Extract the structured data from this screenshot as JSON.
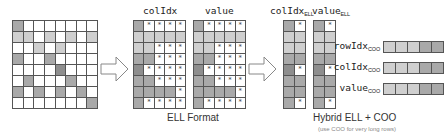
{
  "colors": {
    "grid_line": "#555555",
    "empty": "#ffffff",
    "light": "#cfcfcf",
    "mid": "#a9a9a9",
    "dark": "#8e8e8e",
    "arrow_stroke": "#888888"
  },
  "dense_matrix": {
    "rows": 8,
    "cols": 8,
    "cells": [
      [
        "mid",
        "",
        "",
        "",
        "",
        "",
        "",
        ""
      ],
      [
        "light",
        "light",
        "",
        "light",
        "",
        "light",
        "",
        "light"
      ],
      [
        "",
        "",
        "light",
        "",
        "light",
        "",
        "",
        ""
      ],
      [
        "mid",
        "",
        "",
        "mid",
        "",
        "",
        "",
        ""
      ],
      [
        "",
        "",
        "",
        "",
        "dark",
        "",
        "",
        ""
      ],
      [
        "",
        "mid",
        "",
        "",
        "",
        "mid",
        "",
        ""
      ],
      [
        "mid",
        "",
        "mid",
        "",
        "mid",
        "",
        "mid",
        ""
      ],
      [
        "",
        "",
        "",
        "",
        "",
        "",
        "",
        "mid"
      ]
    ]
  },
  "ell": {
    "caption": "ELL Format",
    "colidx_label": "colIdx",
    "value_label": "value",
    "cells": [
      [
        "mid",
        "*",
        "*",
        "*",
        "*"
      ],
      [
        "light",
        "light",
        "light",
        "light",
        "light"
      ],
      [
        "light",
        "light",
        "*",
        "*",
        "*"
      ],
      [
        "mid",
        "mid",
        "*",
        "*",
        "*"
      ],
      [
        "dark",
        "*",
        "*",
        "*",
        "*"
      ],
      [
        "mid",
        "mid",
        "*",
        "*",
        "*"
      ],
      [
        "mid",
        "mid",
        "mid",
        "mid",
        "*"
      ],
      [
        "mid",
        "*",
        "*",
        "*",
        "*"
      ]
    ]
  },
  "hybrid": {
    "caption": "Hybrid ELL + COO",
    "note": "(use COO for very long rows)",
    "colidx_label": "colIdx",
    "colidx_sub": "ELL",
    "value_label": "value",
    "value_sub": "ELL",
    "cells": [
      [
        "mid",
        "*"
      ],
      [
        "light",
        "light"
      ],
      [
        "light",
        "light"
      ],
      [
        "mid",
        "mid"
      ],
      [
        "dark",
        "*"
      ],
      [
        "mid",
        "mid"
      ],
      [
        "mid",
        "mid"
      ],
      [
        "mid",
        "*"
      ]
    ],
    "coo": [
      {
        "label": "rowIdx",
        "sub": "COO",
        "cells": [
          "light",
          "light",
          "light",
          "mid",
          "mid"
        ]
      },
      {
        "label": "colIdx",
        "sub": "COO",
        "cells": [
          "light",
          "light",
          "light",
          "mid",
          "mid"
        ]
      },
      {
        "label": "value",
        "sub": "COO",
        "cells": [
          "light",
          "light",
          "light",
          "mid",
          "mid"
        ]
      }
    ]
  },
  "icons": {
    "arrow_1": "right-arrow-icon",
    "arrow_2": "right-arrow-icon"
  }
}
